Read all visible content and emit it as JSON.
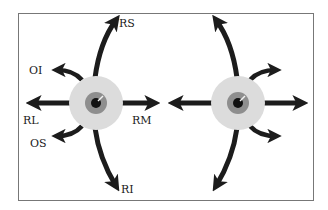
{
  "figure": {
    "colors": {
      "arrow": "#1c1c1c",
      "sclera": "#dcdcdc",
      "iris": "#8e8e8e",
      "pupil": "#111111",
      "frame": "#777777",
      "background": "#ffffff"
    }
  },
  "left_eye": {
    "labels": {
      "superior_rectus": "RS",
      "inferior_oblique": "OI",
      "lateral_rectus": "RL",
      "medial_rectus": "RM",
      "superior_oblique": "OS",
      "inferior_rectus": "RI"
    }
  },
  "right_eye": {
    "labels": {}
  }
}
